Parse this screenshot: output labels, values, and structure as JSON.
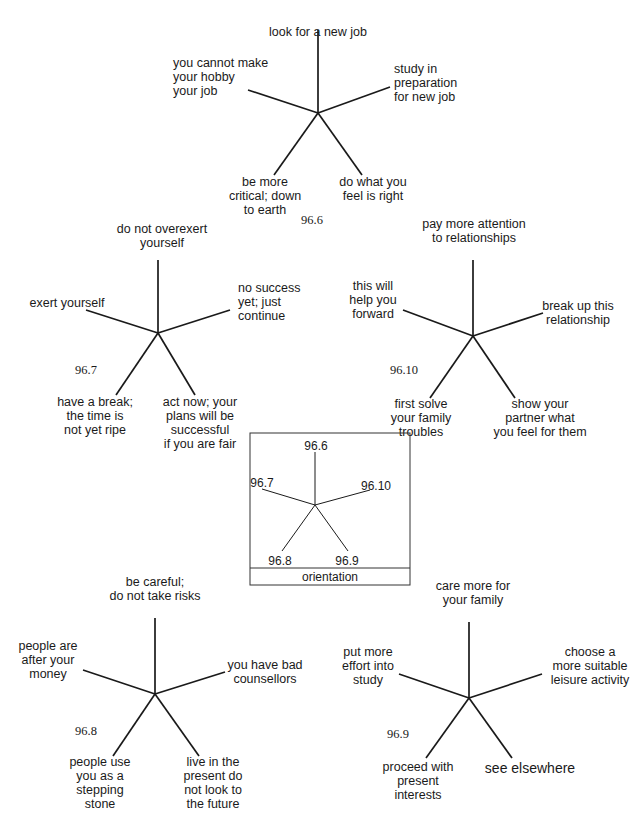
{
  "diagrams": [
    {
      "id": "96.6",
      "center": [
        318,
        113
      ],
      "id_pos": [
        312,
        224
      ],
      "spokes": [
        {
          "dir": "up",
          "end": [
            318,
            30
          ],
          "label": [
            "look for a new job"
          ],
          "anchor": "middle",
          "pos": [
            318,
            36
          ],
          "dy": -1
        },
        {
          "dir": "upper-left",
          "end": [
            248,
            90
          ],
          "label": [
            "you cannot make",
            "your hobby",
            "your job"
          ],
          "anchor": "start",
          "pos": [
            173,
            77
          ]
        },
        {
          "dir": "upper-right",
          "end": [
            390,
            87
          ],
          "label": [
            "study in",
            "preparation",
            "for new job"
          ],
          "anchor": "start",
          "pos": [
            394,
            83
          ]
        },
        {
          "dir": "lower-left",
          "end": [
            274,
            175
          ],
          "label": [
            "be more",
            "critical; down",
            "to earth"
          ],
          "anchor": "middle",
          "pos": [
            265,
            186
          ]
        },
        {
          "dir": "lower-right",
          "end": [
            362,
            175
          ],
          "label": [
            "do what you",
            "feel is right"
          ],
          "anchor": "middle",
          "pos": [
            373,
            186
          ]
        }
      ]
    },
    {
      "id": "96.7",
      "center": [
        158,
        333
      ],
      "id_pos": [
        86,
        374
      ],
      "spokes": [
        {
          "dir": "up",
          "end": [
            158,
            260
          ],
          "label": [
            "do not overexert",
            "yourself"
          ],
          "anchor": "middle",
          "pos": [
            162,
            247
          ]
        },
        {
          "dir": "upper-left",
          "end": [
            86,
            310
          ],
          "label": [
            "exert yourself"
          ],
          "anchor": "middle",
          "pos": [
            67,
            303
          ]
        },
        {
          "dir": "upper-right",
          "end": [
            230,
            310
          ],
          "label": [
            "no success",
            "yet; just",
            "continue"
          ],
          "anchor": "start",
          "pos": [
            238,
            302
          ]
        },
        {
          "dir": "lower-left",
          "end": [
            116,
            395
          ],
          "label": [
            "have a break;",
            "the time is",
            "not yet ripe"
          ],
          "anchor": "middle",
          "pos": [
            95,
            406
          ]
        },
        {
          "dir": "lower-right",
          "end": [
            195,
            395
          ],
          "label": [
            "act now; your",
            "plans will be",
            "successful",
            "if you are fair"
          ],
          "anchor": "middle",
          "pos": [
            200,
            406
          ]
        }
      ]
    },
    {
      "id": "96.10",
      "center": [
        473,
        336
      ],
      "id_pos": [
        404,
        374
      ],
      "spokes": [
        {
          "dir": "up",
          "end": [
            473,
            260
          ],
          "label": [
            "pay more attention",
            "to relationships"
          ],
          "anchor": "middle",
          "pos": [
            474,
            242
          ]
        },
        {
          "dir": "upper-left",
          "end": [
            403,
            310
          ],
          "label": [
            "this will",
            "help you",
            "forward"
          ],
          "anchor": "middle",
          "pos": [
            373,
            300
          ]
        },
        {
          "dir": "upper-right",
          "end": [
            543,
            313
          ],
          "label": [
            "break up this",
            "relationship"
          ],
          "anchor": "middle",
          "pos": [
            578,
            306
          ]
        },
        {
          "dir": "lower-left",
          "end": [
            430,
            398
          ],
          "label": [
            "first solve",
            "your family",
            "troubles"
          ],
          "anchor": "middle",
          "pos": [
            421,
            408
          ]
        },
        {
          "dir": "lower-right",
          "end": [
            515,
            398
          ],
          "label": [
            "show your",
            "partner what",
            "you feel for them"
          ],
          "anchor": "middle",
          "pos": [
            540,
            408
          ]
        }
      ]
    },
    {
      "id": "96.8",
      "center": [
        155,
        694
      ],
      "id_pos": [
        86,
        735
      ],
      "spokes": [
        {
          "dir": "up",
          "end": [
            155,
            618
          ],
          "label": [
            "be careful;",
            "do not take risks"
          ],
          "anchor": "middle",
          "pos": [
            155,
            600
          ]
        },
        {
          "dir": "upper-left",
          "end": [
            83,
            670
          ],
          "label": [
            "people are",
            "after your",
            "money"
          ],
          "anchor": "middle",
          "pos": [
            48,
            660
          ]
        },
        {
          "dir": "upper-right",
          "end": [
            225,
            672
          ],
          "label": [
            "you have bad",
            "counsellors"
          ],
          "anchor": "middle",
          "pos": [
            265,
            665
          ]
        },
        {
          "dir": "lower-left",
          "end": [
            113,
            756
          ],
          "label": [
            "people use",
            "you as a",
            "stepping",
            "stone"
          ],
          "anchor": "middle",
          "pos": [
            100,
            766
          ]
        },
        {
          "dir": "lower-right",
          "end": [
            199,
            756
          ],
          "label": [
            "live in the",
            "present do",
            "not look to",
            "the future"
          ],
          "anchor": "middle",
          "pos": [
            213,
            766
          ]
        }
      ]
    },
    {
      "id": "96.9",
      "center": [
        469,
        698
      ],
      "id_pos": [
        398,
        738
      ],
      "spokes": [
        {
          "dir": "up",
          "end": [
            469,
            622
          ],
          "label": [
            "care more for",
            "your family"
          ],
          "anchor": "middle",
          "pos": [
            473,
            604
          ]
        },
        {
          "dir": "upper-left",
          "end": [
            399,
            674
          ],
          "label": [
            "put more",
            "effort into",
            "study"
          ],
          "anchor": "middle",
          "pos": [
            368,
            666
          ]
        },
        {
          "dir": "upper-right",
          "end": [
            542,
            674
          ],
          "label": [
            "choose a",
            "more suitable",
            "leisure activity"
          ],
          "anchor": "middle",
          "pos": [
            590,
            666
          ]
        },
        {
          "dir": "lower-left",
          "end": [
            426,
            758
          ],
          "label": [
            "proceed with",
            "present",
            "interests"
          ],
          "anchor": "middle",
          "pos": [
            418,
            771
          ]
        },
        {
          "dir": "lower-right",
          "end": [
            512,
            758
          ],
          "label": [
            "see elsewhere"
          ],
          "anchor": "middle",
          "pos": [
            530,
            773
          ],
          "big": true
        }
      ]
    }
  ],
  "orientation_key": {
    "title": "orientation",
    "box": [
      250,
      433,
      160,
      152
    ],
    "center": [
      315,
      505
    ],
    "spokes": [
      {
        "end": [
          315,
          452
        ],
        "label": "96.6",
        "pos": [
          316,
          450
        ],
        "anchor": "middle"
      },
      {
        "end": [
          262,
          489
        ],
        "label": "96.7",
        "pos": [
          262,
          487
        ],
        "anchor": "middle"
      },
      {
        "end": [
          370,
          490
        ],
        "label": "96.10",
        "pos": [
          376,
          490
        ],
        "anchor": "middle"
      },
      {
        "end": [
          282,
          551
        ],
        "label": "96.8",
        "pos": [
          280,
          565
        ],
        "anchor": "middle"
      },
      {
        "end": [
          348,
          551
        ],
        "label": "96.9",
        "pos": [
          347,
          565
        ],
        "anchor": "middle"
      }
    ]
  }
}
